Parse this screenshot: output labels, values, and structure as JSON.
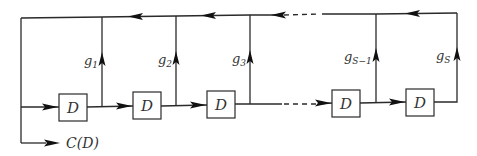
{
  "diagram": {
    "type": "shift-register feedback block diagram",
    "delay_blocks": [
      {
        "label": "D"
      },
      {
        "label": "D"
      },
      {
        "label": "D"
      },
      {
        "label": "D"
      },
      {
        "label": "D"
      }
    ],
    "taps": [
      {
        "base": "g",
        "sub": "1"
      },
      {
        "base": "g",
        "sub": "2"
      },
      {
        "base": "g",
        "sub": "3"
      },
      {
        "base": "g",
        "sub": "S−1"
      },
      {
        "base": "g",
        "sub": "S"
      }
    ],
    "output": {
      "label": "C(D)"
    },
    "colors": {
      "line": "#2a2a2a",
      "background": "#ffffff"
    }
  }
}
